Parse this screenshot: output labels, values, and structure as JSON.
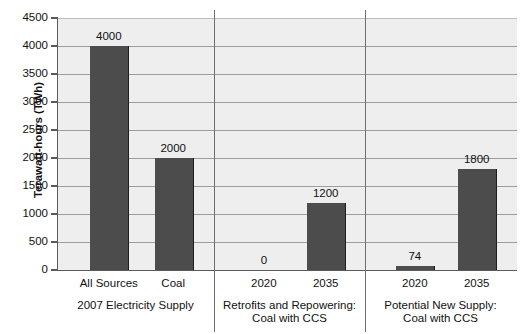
{
  "chart_data": {
    "type": "bar",
    "title": "",
    "xlabel": "",
    "ylabel": "Terawatt-hours (TWh)",
    "ylim": [
      0,
      4500
    ],
    "ytick_values": [
      0,
      500,
      1000,
      1500,
      2000,
      2500,
      3000,
      3500,
      4000,
      4500
    ],
    "ytick_labels": [
      "0",
      "500",
      "1000",
      "1500",
      "2000",
      "2500",
      "3000",
      "3500",
      "4000",
      "4500"
    ],
    "grid": true,
    "legend": "none",
    "categories": [
      "All Sources",
      "Coal",
      "2020",
      "2035",
      "2020",
      "2035"
    ],
    "values": [
      4000,
      2000,
      0,
      1200,
      74,
      1800
    ],
    "value_labels": [
      "4000",
      "2000",
      "0",
      "1200",
      "74",
      "1800"
    ],
    "groups": [
      {
        "label": "2007 Electricity Supply",
        "categories": [
          "All Sources",
          "Coal"
        ],
        "values": [
          4000,
          2000
        ]
      },
      {
        "label": "Retrofits and Repowering:\nCoal with CCS",
        "categories": [
          "2020",
          "2035"
        ],
        "values": [
          0,
          1200
        ]
      },
      {
        "label": "Potential New Supply:\nCoal with CCS",
        "categories": [
          "2020",
          "2035"
        ],
        "values": [
          74,
          1800
        ]
      }
    ],
    "colors": {
      "bar_fill": "#4c4c4c",
      "bar_edge": "#1d1d1d",
      "plot_background": "#eeeeee",
      "gridline": "#9d9d9d",
      "axis": "#5a5a5a",
      "text": "#111111"
    }
  }
}
